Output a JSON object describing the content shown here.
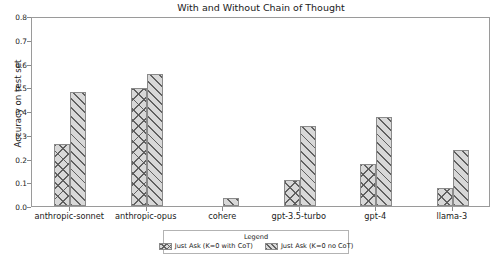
{
  "chart_data": {
    "type": "bar",
    "title": "With and Without Chain of Thought",
    "xlabel": "",
    "ylabel": "Accuracy on test set",
    "ylim": [
      0.0,
      0.8
    ],
    "ytick_labels": [
      "0.0",
      "0.1",
      "0.2",
      "0.3",
      "0.4",
      "0.5",
      "0.6",
      "0.7",
      "0.8"
    ],
    "ytick_values": [
      0.0,
      0.1,
      0.2,
      0.3,
      0.4,
      0.5,
      0.6,
      0.7,
      0.8
    ],
    "grid": false,
    "legend_position": "below-axes",
    "legend_title": "Legend",
    "categories": [
      "anthropic-sonnet",
      "anthropic-opus",
      "cohere",
      "gpt-3.5-turbo",
      "gpt-4",
      "llama-3"
    ],
    "series": [
      {
        "name": "Just Ask (K=0 with CoT)",
        "hatch": "chevron",
        "color": "#d8d8d8",
        "values": [
          0.26,
          0.495,
          0.0,
          0.11,
          0.175,
          0.075
        ]
      },
      {
        "name": "Just Ask (K=0 no CoT)",
        "hatch": "diagonal",
        "color": "#d8d8d8",
        "values": [
          0.48,
          0.555,
          0.035,
          0.335,
          0.375,
          0.235
        ]
      }
    ]
  }
}
